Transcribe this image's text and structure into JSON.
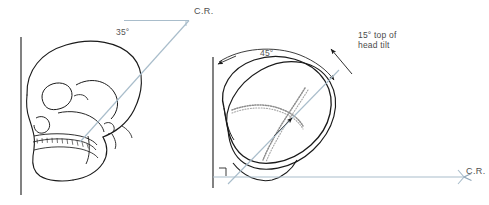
{
  "figure": {
    "background_color": "#ffffff",
    "ray_color": "#9db3c4",
    "outline_color": "#1a1a1a",
    "suture_color": "#8d8d8d",
    "text_color": "#4a4a4a",
    "width": 489,
    "height": 205
  },
  "labels": {
    "angle_35": "35°",
    "cr_left": "C.R.",
    "angle_45": "45°",
    "head_tilt_line1": "15° top of",
    "head_tilt_line2": "head tilt",
    "cr_right": "C.R."
  },
  "panels": [
    {
      "name": "lateral-skull-view",
      "view": "lateral",
      "reference_line": "vertical",
      "central_ray_angle": "35°",
      "central_ray_label": "C.R."
    },
    {
      "name": "superior-skull-view",
      "view": "superior",
      "reference_line": "vertical",
      "rotation_angle": "45°",
      "tilt_angle": "15°",
      "tilt_description": "top of head tilt",
      "central_ray_label": "C.R."
    }
  ]
}
